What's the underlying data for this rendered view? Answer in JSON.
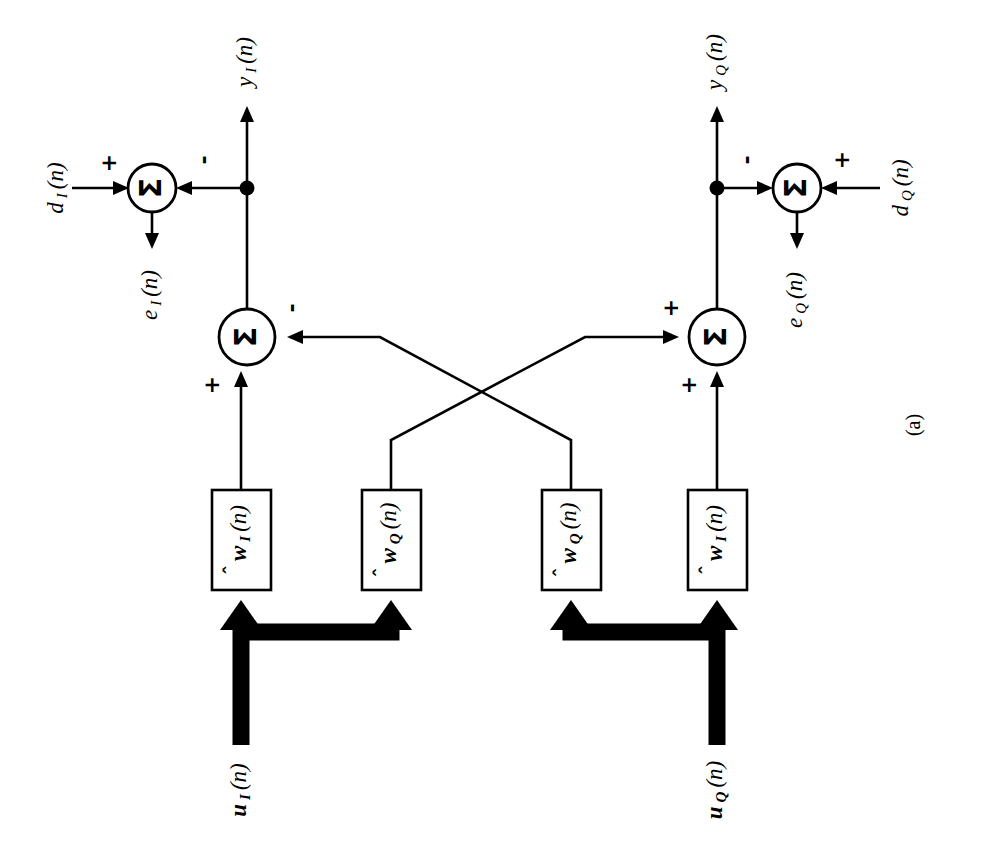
{
  "figure": {
    "caption": "(a)",
    "sigma_glyph": "Σ",
    "plus": "+",
    "minus": "-",
    "hat": "ˆ",
    "paren_open": "(",
    "paren_close": ")",
    "arg": "n"
  },
  "signals": {
    "d_I": {
      "base": "d",
      "sub": "I",
      "arg": "(n)",
      "full": "d_I(n)"
    },
    "d_Q": {
      "base": "d",
      "sub": "Q",
      "arg": "(n)",
      "full": "d_Q(n)"
    },
    "e_I": {
      "base": "e",
      "sub": "I",
      "arg": "(n)",
      "full": "e_I(n)"
    },
    "e_Q": {
      "base": "e",
      "sub": "Q",
      "arg": "(n)",
      "full": "e_Q(n)"
    },
    "y_I": {
      "base": "y",
      "sub": "I",
      "arg": "(n)",
      "full": "y_I(n)"
    },
    "y_Q": {
      "base": "y",
      "sub": "Q",
      "arg": "(n)",
      "full": "y_Q(n)"
    },
    "u_I": {
      "base": "u",
      "sub": "I",
      "arg": "(n)",
      "full": "u_I(n)"
    },
    "u_Q": {
      "base": "u",
      "sub": "Q",
      "arg": "(n)",
      "full": "u_Q(n)"
    }
  },
  "blocks": [
    {
      "id": "w-I-left",
      "base": "w",
      "sub": "I",
      "arg": "(n)",
      "full": "w_I(n)",
      "hat": true
    },
    {
      "id": "w-Q-left",
      "base": "w",
      "sub": "Q",
      "arg": "(n)",
      "full": "w_Q(n)",
      "hat": true
    },
    {
      "id": "w-Q-right",
      "base": "w",
      "sub": "Q",
      "arg": "(n)",
      "full": "w_Q(n)",
      "hat": true
    },
    {
      "id": "w-I-right",
      "base": "w",
      "sub": "I",
      "arg": "(n)",
      "full": "w_I(n)",
      "hat": true
    }
  ],
  "adders": [
    {
      "id": "sum-error-I",
      "glyph": "Σ",
      "inputs": [
        "+",
        "-"
      ],
      "output": "e_I(n)"
    },
    {
      "id": "sum-output-I",
      "glyph": "Σ",
      "inputs": [
        "+",
        "-"
      ],
      "output": "y_I(n)"
    },
    {
      "id": "sum-output-Q",
      "glyph": "Σ",
      "inputs": [
        "+",
        "+"
      ],
      "output": "y_Q(n)"
    },
    {
      "id": "sum-error-Q",
      "glyph": "Σ",
      "inputs": [
        "-",
        "+"
      ],
      "output": "e_Q(n)"
    }
  ],
  "signs": {
    "err_I_left": "+",
    "err_I_right": "-",
    "out_I_cross": "-",
    "out_I_vert": "+",
    "out_Q_cross": "+",
    "out_Q_vert": "+",
    "err_Q_left": "-",
    "err_Q_right": "+"
  },
  "colors": {
    "ink": "#000000",
    "paper": "#ffffff"
  }
}
